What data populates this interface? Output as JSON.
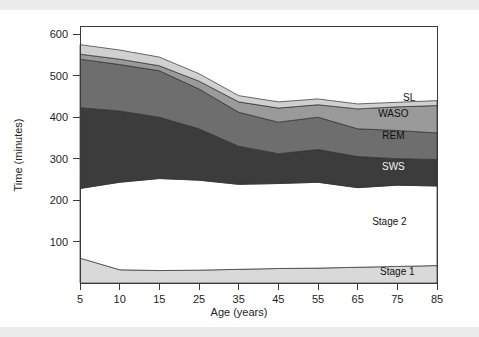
{
  "figure": {
    "background_color": "#ffffff",
    "scan_band_color": "#ececed"
  },
  "chart_data": {
    "type": "area",
    "title": "",
    "subtitle": "",
    "xlabel": "Age (years)",
    "ylabel": "Time (minutes)",
    "stacked": true,
    "grid": false,
    "legend_position": "inline-right",
    "x": [
      5,
      10,
      15,
      25,
      35,
      45,
      55,
      65,
      75,
      85
    ],
    "xtick_labels": [
      "5",
      "10",
      "15",
      "25",
      "35",
      "45",
      "55",
      "65",
      "75",
      "85"
    ],
    "ytick_labels": [
      "100",
      "200",
      "300",
      "400",
      "500",
      "600"
    ],
    "yticks": [
      100,
      200,
      300,
      400,
      500,
      600
    ],
    "ylim": [
      0,
      620
    ],
    "xlim": [
      5,
      85
    ],
    "boundaries_note": "cumulative stacked upper boundaries, minutes",
    "cumulative_boundaries": {
      "stage1_top": [
        60,
        32,
        30,
        31,
        33,
        35,
        36,
        38,
        40,
        42
      ],
      "stage2_top": [
        228,
        243,
        252,
        248,
        238,
        240,
        243,
        230,
        236,
        234
      ],
      "sws_top": [
        423,
        415,
        400,
        372,
        330,
        312,
        322,
        305,
        300,
        298
      ],
      "rem_top": [
        540,
        527,
        512,
        468,
        412,
        388,
        400,
        372,
        368,
        362
      ],
      "waso_top": [
        552,
        540,
        524,
        487,
        437,
        422,
        430,
        420,
        425,
        428
      ],
      "sl_top": [
        575,
        562,
        545,
        505,
        452,
        437,
        444,
        432,
        436,
        440
      ]
    },
    "series": [
      {
        "name": "Stage 1",
        "label": "Stage 1",
        "color": "#d9d9d9",
        "label_x": 75,
        "label_y": 20,
        "values": [
          60,
          32,
          30,
          31,
          33,
          35,
          36,
          38,
          40,
          42
        ]
      },
      {
        "name": "Stage 2",
        "label": "Stage 2",
        "color": "#ffffff",
        "label_x": 73,
        "label_y": 140,
        "values": [
          168,
          211,
          222,
          217,
          205,
          205,
          207,
          192,
          196,
          192
        ]
      },
      {
        "name": "SWS",
        "label": "SWS",
        "color": "#3c3c3c",
        "label_x": 74,
        "label_y": 272,
        "values": [
          195,
          172,
          148,
          124,
          92,
          72,
          79,
          75,
          64,
          64
        ]
      },
      {
        "name": "REM",
        "label": "REM",
        "color": "#6e6e6e",
        "label_x": 74,
        "label_y": 348,
        "values": [
          117,
          112,
          112,
          96,
          82,
          76,
          78,
          67,
          68,
          64
        ]
      },
      {
        "name": "WASO",
        "label": "WASO",
        "color": "#9a9a9a",
        "label_x": 74,
        "label_y": 400,
        "values": [
          12,
          13,
          12,
          19,
          25,
          34,
          30,
          48,
          57,
          66
        ]
      },
      {
        "name": "SL",
        "label": "SL",
        "color": "#d0d0d0",
        "label_x": 78,
        "label_y": 438,
        "values": [
          23,
          22,
          21,
          18,
          15,
          15,
          14,
          12,
          11,
          12
        ]
      }
    ]
  }
}
